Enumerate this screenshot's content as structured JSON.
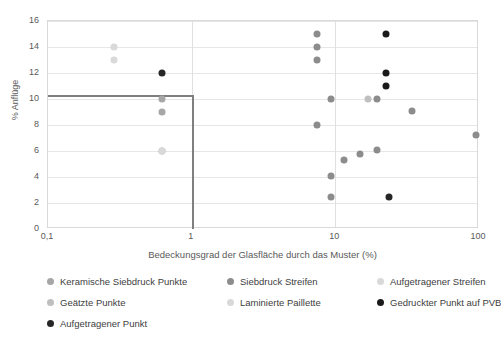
{
  "chart_data": {
    "type": "scatter",
    "title": "",
    "xlabel": "Bedeckungsgrad der Glasfläche durch das Muster (%)",
    "ylabel": "% Anflüge",
    "xscale": "log",
    "xlim": [
      0.1,
      100
    ],
    "ylim": [
      0,
      16
    ],
    "xticks": [
      "0,1",
      "1",
      "10",
      "100"
    ],
    "xtick_values": [
      0.1,
      1,
      10,
      100
    ],
    "yticks": [
      "0",
      "2",
      "4",
      "6",
      "8",
      "10",
      "12",
      "14",
      "16"
    ],
    "ytick_values": [
      0,
      2,
      4,
      6,
      8,
      10,
      12,
      14,
      16
    ],
    "grid": "horizontal",
    "legend_position": "bottom",
    "annotations": [
      {
        "name": "threshold-line",
        "description": "Schwellenlinie",
        "y": 10.3,
        "x_start": 0.1,
        "x_end": 1.0,
        "vertical_x": 1.0,
        "vertical_y_from": 10.3,
        "vertical_y_to": 0,
        "color": "#7f7f7f"
      }
    ],
    "series": [
      {
        "name": "Keramische Siebdruck Punkte",
        "color": "#a6a6a6",
        "points": [
          {
            "x": 0.62,
            "y": 10.0
          },
          {
            "x": 0.62,
            "y": 9.0
          },
          {
            "x": 0.62,
            "y": 6.0
          }
        ]
      },
      {
        "name": "Siebdruck Streifen",
        "color": "#8c8c8c",
        "points": [
          {
            "x": 7.4,
            "y": 15.0
          },
          {
            "x": 7.4,
            "y": 14.0
          },
          {
            "x": 7.4,
            "y": 13.0
          },
          {
            "x": 7.4,
            "y": 8.0
          },
          {
            "x": 9.3,
            "y": 10.0
          },
          {
            "x": 9.3,
            "y": 4.1
          },
          {
            "x": 9.3,
            "y": 2.5
          },
          {
            "x": 11.4,
            "y": 5.3
          },
          {
            "x": 14.8,
            "y": 5.8
          },
          {
            "x": 19.5,
            "y": 6.1
          },
          {
            "x": 19.5,
            "y": 10.0
          },
          {
            "x": 34.0,
            "y": 9.1
          },
          {
            "x": 95.0,
            "y": 7.2
          }
        ]
      },
      {
        "name": "Aufgetragener Streifen",
        "color": "#d9d9d9",
        "points": [
          {
            "x": 0.29,
            "y": 14.0
          },
          {
            "x": 0.29,
            "y": 13.0
          }
        ]
      },
      {
        "name": "Geätzte Punkte",
        "color": "#bfbfbf",
        "points": [
          {
            "x": 17.0,
            "y": 10.0
          }
        ]
      },
      {
        "name": "Laminierte Paillette",
        "color": "#d9d9d9",
        "points": [
          {
            "x": 0.62,
            "y": 6.0
          }
        ]
      },
      {
        "name": "Gedruckter Punkt auf PVB",
        "color": "#1a1a1a",
        "points": [
          {
            "x": 22.5,
            "y": 15.0
          },
          {
            "x": 22.5,
            "y": 12.0
          },
          {
            "x": 22.5,
            "y": 11.0
          }
        ]
      },
      {
        "name": "Aufgetragener Punkt",
        "color": "#262626",
        "points": [
          {
            "x": 0.62,
            "y": 12.0
          },
          {
            "x": 23.5,
            "y": 2.5
          }
        ]
      }
    ]
  },
  "legend": {
    "items": [
      {
        "label": "Keramische Siebdruck Punkte",
        "color": "#a6a6a6"
      },
      {
        "label": "Siebdruck Streifen",
        "color": "#8c8c8c"
      },
      {
        "label": "Aufgetragener Streifen",
        "color": "#d9d9d9"
      },
      {
        "label": "Geätzte Punkte",
        "color": "#bfbfbf"
      },
      {
        "label": "Laminierte Paillette",
        "color": "#d9d9d9"
      },
      {
        "label": "Gedruckter Punkt auf PVB",
        "color": "#1a1a1a"
      },
      {
        "label": "Aufgetragener Punkt",
        "color": "#262626"
      }
    ]
  }
}
